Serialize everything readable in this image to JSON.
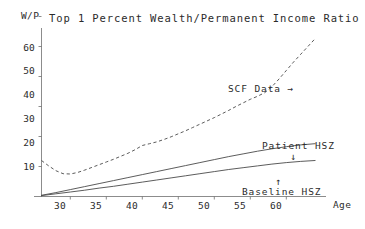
{
  "chart_data": {
    "type": "line",
    "title": "Top 1 Percent Wealth/Permanent Income Ratio",
    "xlabel": "Age",
    "ylabel": "W/P",
    "xlim": [
      26,
      64
    ],
    "ylim": [
      0,
      66
    ],
    "xticks": [
      30,
      35,
      40,
      45,
      50,
      55,
      60
    ],
    "yticks": [
      10,
      20,
      30,
      40,
      50,
      60
    ],
    "grid": false,
    "legend_position": "inline-annotations",
    "annotations": [
      {
        "text": "SCF Data →",
        "series": "SCF Data",
        "x": 54,
        "y": 42
      },
      {
        "text": "Patient HSZ",
        "series": "Patient HSZ",
        "x": 61,
        "y": 22
      },
      {
        "text": "↓",
        "series": "Patient HSZ",
        "x": 61,
        "y": 19
      },
      {
        "text": "↑",
        "series": "Baseline HSZ",
        "x": 58,
        "y": 8
      },
      {
        "text": "Baseline HSZ",
        "series": "Baseline HSZ",
        "x": 58,
        "y": 5
      }
    ],
    "series": [
      {
        "name": "SCF Data",
        "style": "dashed",
        "x": [
          26,
          27,
          28,
          29,
          30,
          31,
          32,
          33,
          34,
          35,
          36,
          37,
          38,
          39,
          40,
          41,
          42,
          43,
          44,
          45,
          46,
          47,
          48,
          49,
          50,
          51,
          52,
          53,
          54,
          55,
          56,
          57,
          58,
          59,
          60,
          61,
          62,
          63,
          64
        ],
        "values": [
          12.0,
          10.2,
          8.6,
          7.6,
          7.5,
          8.0,
          8.8,
          9.7,
          10.6,
          11.5,
          12.4,
          13.4,
          14.4,
          15.6,
          17.0,
          17.6,
          18.2,
          19.0,
          19.9,
          20.9,
          21.9,
          23.0,
          24.1,
          25.2,
          26.3,
          27.5,
          28.7,
          30.0,
          31.2,
          32.4,
          33.4,
          34.6,
          36.6,
          39.2,
          42.0,
          44.8,
          47.4,
          50.0,
          52.6
        ]
      },
      {
        "name": "Patient HSZ",
        "style": "solid",
        "x": [
          26,
          28,
          30,
          32,
          34,
          36,
          38,
          40,
          42,
          44,
          46,
          48,
          50,
          52,
          54,
          56,
          58,
          60,
          62,
          64
        ],
        "values": [
          0.4,
          1.3,
          2.3,
          3.3,
          4.3,
          5.3,
          6.3,
          7.3,
          8.3,
          9.3,
          10.3,
          11.3,
          12.3,
          13.3,
          14.2,
          15.1,
          15.9,
          16.6,
          17.2,
          17.6
        ]
      },
      {
        "name": "Baseline HSZ",
        "style": "solid",
        "x": [
          26,
          28,
          30,
          32,
          34,
          36,
          38,
          40,
          42,
          44,
          46,
          48,
          50,
          52,
          54,
          56,
          58,
          60,
          62,
          64
        ],
        "values": [
          0.3,
          0.9,
          1.5,
          2.1,
          2.8,
          3.4,
          4.1,
          4.8,
          5.5,
          6.2,
          6.9,
          7.6,
          8.3,
          9.0,
          9.6,
          10.2,
          10.8,
          11.3,
          11.7,
          12.0
        ]
      }
    ]
  },
  "labels": {
    "y_axis_title": "W/P",
    "x_axis_title": "Age",
    "title": "Top 1 Percent Wealth/Permanent Income Ratio",
    "yticks": [
      "10",
      "20",
      "30",
      "40",
      "50",
      "60"
    ],
    "xticks": [
      "30",
      "35",
      "40",
      "45",
      "50",
      "55",
      "60"
    ],
    "scf_annotation": "SCF Data →",
    "patient_annotation": "Patient HSZ",
    "patient_arrow": "↓",
    "baseline_arrow": "↑",
    "baseline_annotation": "Baseline HSZ"
  }
}
